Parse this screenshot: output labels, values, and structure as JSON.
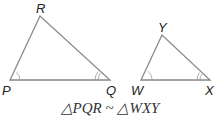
{
  "diagram": {
    "triangle1": {
      "vertices": {
        "P": "P",
        "Q": "Q",
        "R": "R"
      }
    },
    "triangle2": {
      "vertices": {
        "W": "W",
        "X": "X",
        "Y": "Y"
      }
    },
    "caption": "△PQR ~ △WXY"
  },
  "colors": {
    "stroke": "#888888",
    "text": "#222222"
  }
}
